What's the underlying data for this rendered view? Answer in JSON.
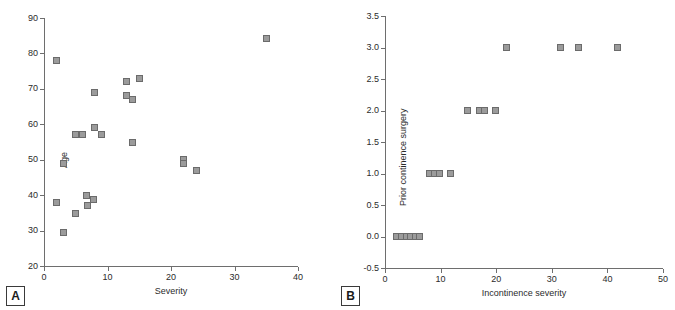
{
  "figure": {
    "background": "#ffffff",
    "marker_fill": "#9b9b9b",
    "marker_stroke": "#6b6b6b",
    "axis_color": "#6e6e6e",
    "text_color": "#2b2b2b"
  },
  "panels": {
    "a": {
      "label": "A"
    },
    "b": {
      "label": "B"
    }
  },
  "chart_data": [
    {
      "panel": "A",
      "type": "scatter",
      "title": "",
      "xlabel": "Severity",
      "ylabel": "Age",
      "xlim": [
        0,
        40
      ],
      "ylim": [
        20,
        90
      ],
      "xticks": [
        0,
        10,
        20,
        30,
        40
      ],
      "yticks": [
        20,
        30,
        40,
        50,
        60,
        70,
        80,
        90
      ],
      "xticklabels": [
        "0",
        "10",
        "20",
        "30",
        "40"
      ],
      "yticklabels": [
        "20",
        "30",
        "40",
        "50",
        "60",
        "70",
        "80",
        "90"
      ],
      "grid": false,
      "legend": "none",
      "marker": "square",
      "points": [
        {
          "x": 2,
          "y": 78
        },
        {
          "x": 2,
          "y": 38
        },
        {
          "x": 3,
          "y": 49
        },
        {
          "x": 3,
          "y": 29.5
        },
        {
          "x": 5,
          "y": 57
        },
        {
          "x": 5,
          "y": 34.8
        },
        {
          "x": 6,
          "y": 57
        },
        {
          "x": 6.7,
          "y": 40
        },
        {
          "x": 6.8,
          "y": 37.2
        },
        {
          "x": 8,
          "y": 69
        },
        {
          "x": 8,
          "y": 59
        },
        {
          "x": 7.8,
          "y": 38.7
        },
        {
          "x": 9,
          "y": 57
        },
        {
          "x": 13,
          "y": 72
        },
        {
          "x": 13,
          "y": 68
        },
        {
          "x": 14,
          "y": 67
        },
        {
          "x": 15,
          "y": 73
        },
        {
          "x": 14,
          "y": 55
        },
        {
          "x": 22,
          "y": 50.2
        },
        {
          "x": 22,
          "y": 49
        },
        {
          "x": 24,
          "y": 47
        },
        {
          "x": 35,
          "y": 84.3
        }
      ]
    },
    {
      "panel": "B",
      "type": "scatter",
      "title": "",
      "xlabel": "Incontinence severity",
      "ylabel": "Prior continence surgery",
      "xlim": [
        0,
        50
      ],
      "ylim": [
        -0.5,
        3.5
      ],
      "xticks": [
        0,
        10,
        20,
        30,
        40,
        50
      ],
      "yticks": [
        -0.5,
        0.0,
        0.5,
        1.0,
        1.5,
        2.0,
        2.5,
        3.0,
        3.5
      ],
      "xticklabels": [
        "0",
        "10",
        "20",
        "30",
        "40",
        "50"
      ],
      "yticklabels": [
        "-0.5",
        "0.0",
        "0.5",
        "1.0",
        "1.5",
        "2.0",
        "2.5",
        "3.0",
        "3.5"
      ],
      "grid": false,
      "legend": "none",
      "marker": "square",
      "points": [
        {
          "x": 2.0,
          "y": 0
        },
        {
          "x": 2.9,
          "y": 0
        },
        {
          "x": 3.8,
          "y": 0
        },
        {
          "x": 4.6,
          "y": 0
        },
        {
          "x": 5.4,
          "y": 0
        },
        {
          "x": 6.2,
          "y": 0
        },
        {
          "x": 8.0,
          "y": 1
        },
        {
          "x": 8.9,
          "y": 1
        },
        {
          "x": 9.8,
          "y": 1
        },
        {
          "x": 11.8,
          "y": 1
        },
        {
          "x": 14.9,
          "y": 2
        },
        {
          "x": 17.0,
          "y": 2
        },
        {
          "x": 17.9,
          "y": 2
        },
        {
          "x": 19.8,
          "y": 2
        },
        {
          "x": 21.8,
          "y": 3
        },
        {
          "x": 31.6,
          "y": 3
        },
        {
          "x": 34.8,
          "y": 3
        },
        {
          "x": 41.8,
          "y": 3
        }
      ]
    }
  ]
}
